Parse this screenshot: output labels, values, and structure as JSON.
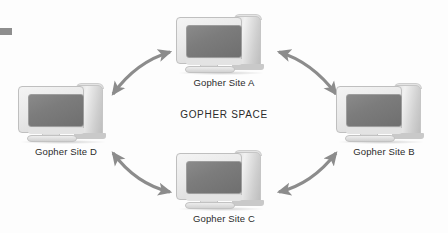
{
  "figure": {
    "center_label": "GOPHER SPACE",
    "background_color": "#fdfdfd",
    "arrow_color": "#8c8c8c",
    "screen_color": "#7c7c7c",
    "bezel_color": "#eaeaea",
    "text_color": "#2b2b2b"
  },
  "nodes": [
    {
      "id": "site-a",
      "label": "Gopher Site A",
      "position": "top"
    },
    {
      "id": "site-b",
      "label": "Gopher Site B",
      "position": "right"
    },
    {
      "id": "site-c",
      "label": "Gopher Site C",
      "position": "bottom"
    },
    {
      "id": "site-d",
      "label": "Gopher Site D",
      "position": "left"
    }
  ],
  "connections": [
    {
      "id": "d-a",
      "from": "Gopher Site D",
      "to": "Gopher Site A",
      "style": "curved-double-headed-arrow"
    },
    {
      "id": "a-b",
      "from": "Gopher Site A",
      "to": "Gopher Site B",
      "style": "curved-double-headed-arrow"
    },
    {
      "id": "b-c",
      "from": "Gopher Site B",
      "to": "Gopher Site C",
      "style": "curved-double-headed-arrow"
    },
    {
      "id": "c-d",
      "from": "Gopher Site C",
      "to": "Gopher Site D",
      "style": "curved-double-headed-arrow"
    }
  ]
}
